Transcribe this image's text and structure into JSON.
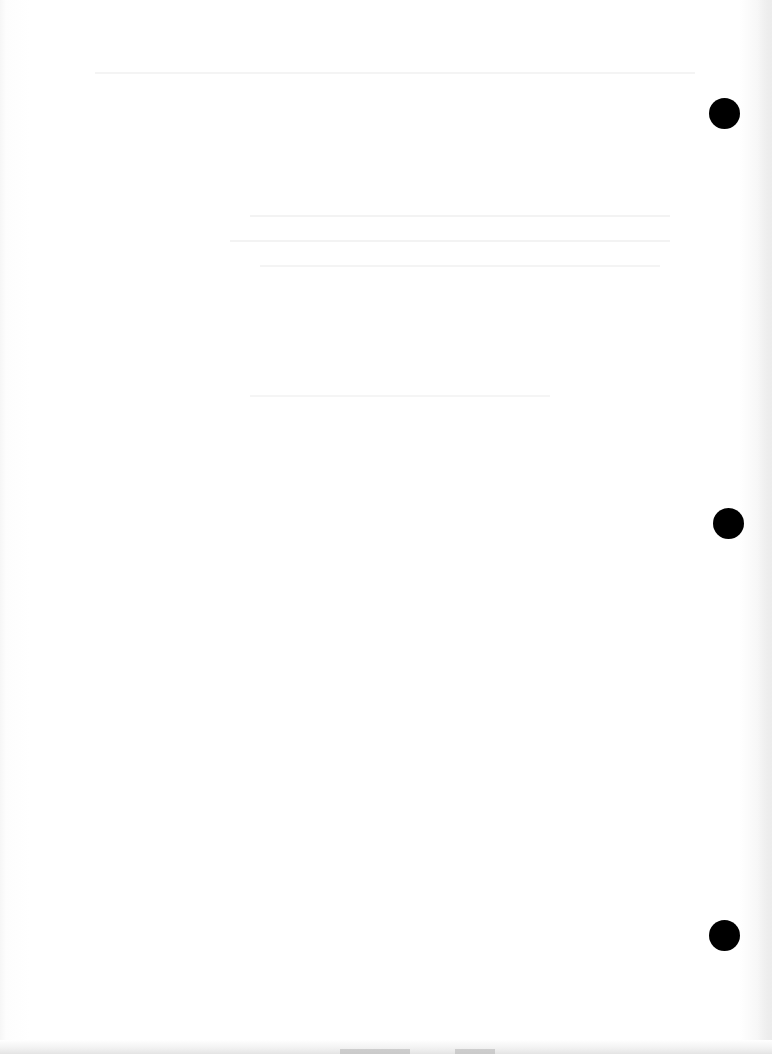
{
  "document": {
    "type": "scanned-blank-page",
    "content_text": "",
    "background_color": "#ffffff",
    "bleed_through_visible": true,
    "punch_holes": [
      {
        "x": 724,
        "y": 113,
        "diameter": 31,
        "color": "#000000"
      },
      {
        "x": 728,
        "y": 523,
        "diameter": 31,
        "color": "#000000"
      },
      {
        "x": 724,
        "y": 935,
        "diameter": 31,
        "color": "#000000"
      }
    ]
  }
}
